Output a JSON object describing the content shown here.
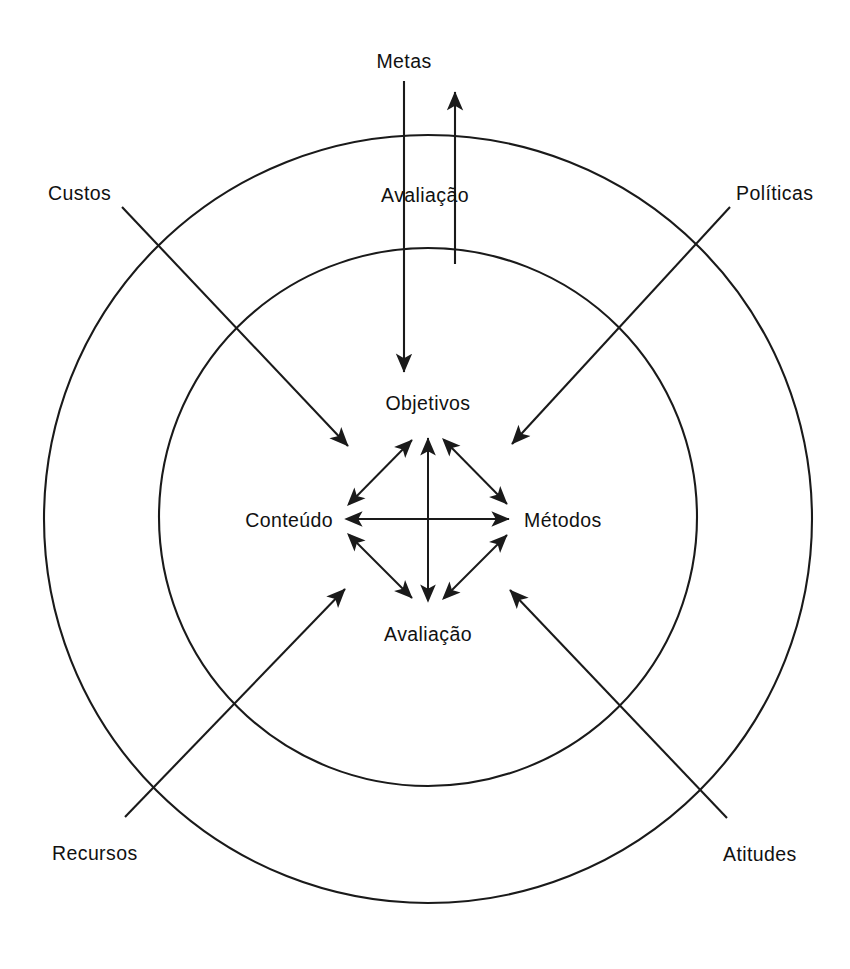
{
  "diagram": {
    "stroke_color": "#1a1a1a",
    "background_color": "#ffffff",
    "rings": [
      {
        "name": "outer-ring",
        "cx": 428,
        "cy": 519,
        "r": 384
      },
      {
        "name": "middle-ring",
        "cx": 428,
        "cy": 517,
        "r": 269
      }
    ],
    "top_label": "Metas",
    "feedback_label": "Avaliação",
    "core_nodes": {
      "top": "Objetivos",
      "left": "Conteúdo",
      "right": "Métodos",
      "bottom": "Avaliação"
    },
    "outer_labels": [
      {
        "id": "custos",
        "text": "Custos",
        "position": "top-left"
      },
      {
        "id": "politicas",
        "text": "Políticas",
        "position": "top-right"
      },
      {
        "id": "recursos",
        "text": "Recursos",
        "position": "bottom-left"
      },
      {
        "id": "atitudes",
        "text": "Atitudes",
        "position": "bottom-right"
      }
    ],
    "connections": [
      {
        "from": "Metas",
        "to": "Objetivos",
        "type": "arrow-down"
      },
      {
        "from": "Avaliação",
        "to": "Metas",
        "type": "arrow-up"
      },
      {
        "from": "Custos",
        "to": "core",
        "type": "arrow-diagonal"
      },
      {
        "from": "Políticas",
        "to": "core",
        "type": "arrow-diagonal"
      },
      {
        "from": "Recursos",
        "to": "core",
        "type": "arrow-diagonal"
      },
      {
        "from": "Atitudes",
        "to": "core",
        "type": "arrow-diagonal"
      },
      {
        "from": "Objetivos",
        "to": "Conteúdo",
        "type": "double-arrow"
      },
      {
        "from": "Objetivos",
        "to": "Métodos",
        "type": "double-arrow"
      },
      {
        "from": "Objetivos",
        "to": "Avaliação",
        "type": "double-arrow"
      },
      {
        "from": "Conteúdo",
        "to": "Métodos",
        "type": "double-arrow"
      },
      {
        "from": "Conteúdo",
        "to": "Avaliação",
        "type": "double-arrow"
      },
      {
        "from": "Métodos",
        "to": "Avaliação",
        "type": "double-arrow"
      }
    ]
  }
}
